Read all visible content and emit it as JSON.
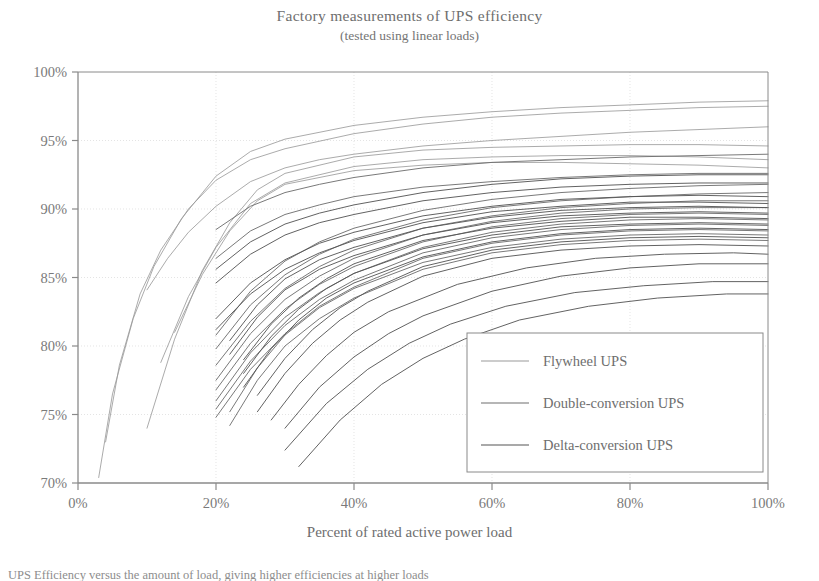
{
  "chart_data": {
    "type": "line",
    "title": "Factory measurements of UPS efficiency",
    "subtitle": "(tested using linear loads)",
    "xlabel": "Percent of rated active power load",
    "ylabel": "",
    "xlim": [
      0,
      100
    ],
    "ylim": [
      70,
      100
    ],
    "xticks": [
      0,
      20,
      40,
      60,
      80,
      100
    ],
    "xtick_labels": [
      "0%",
      "20%",
      "40%",
      "60%",
      "80%",
      "100%"
    ],
    "yticks": [
      70,
      75,
      80,
      85,
      90,
      95,
      100
    ],
    "ytick_labels": [
      "70%",
      "75%",
      "80%",
      "85%",
      "90%",
      "95%",
      "100%"
    ],
    "grid": true,
    "grid_color": "#d8d8d8",
    "axis_color": "#8a8a8a",
    "background": "#ffffff",
    "legend_position": "lower right",
    "legend": [
      {
        "name": "Flywheel UPS",
        "color": "#9a9a9a"
      },
      {
        "name": "Double-conversion UPS",
        "color": "#6e6e6e"
      },
      {
        "name": "Delta-conversion UPS",
        "color": "#555555"
      }
    ],
    "series": [
      {
        "name": "Flywheel UPS",
        "group": "flywheel",
        "color": "#9a9a9a",
        "width": 0.9,
        "x": [
          3,
          5,
          8,
          11,
          15,
          20,
          25,
          30,
          40,
          50,
          60,
          70,
          80,
          90,
          100
        ],
        "y": [
          70.4,
          76.5,
          82.0,
          85.8,
          89.3,
          92.4,
          94.2,
          95.1,
          96.1,
          96.7,
          97.1,
          97.4,
          97.6,
          97.8,
          97.9
        ]
      },
      {
        "name": "Flywheel UPS",
        "group": "flywheel",
        "color": "#9a9a9a",
        "width": 0.9,
        "x": [
          4,
          6,
          9,
          12,
          16,
          20,
          25,
          30,
          40,
          50,
          60,
          70,
          80,
          90,
          100
        ],
        "y": [
          73.0,
          78.6,
          83.8,
          87.0,
          90.0,
          92.1,
          93.6,
          94.4,
          95.5,
          96.2,
          96.7,
          97.0,
          97.2,
          97.4,
          97.5
        ]
      },
      {
        "name": "Flywheel UPS",
        "group": "flywheel",
        "color": "#9a9a9a",
        "width": 0.9,
        "x": [
          10,
          13,
          16,
          20,
          25,
          30,
          35,
          40,
          50,
          60,
          70,
          80,
          90,
          100
        ],
        "y": [
          84.1,
          86.4,
          88.3,
          90.2,
          92.0,
          93.0,
          93.6,
          94.0,
          94.6,
          95.0,
          95.3,
          95.6,
          95.8,
          96.0
        ]
      },
      {
        "name": "Flywheel UPS",
        "group": "flywheel",
        "color": "#9a9a9a",
        "width": 0.9,
        "x": [
          10,
          14,
          18,
          22,
          26,
          30,
          40,
          50,
          60,
          70,
          80,
          90,
          100
        ],
        "y": [
          74.0,
          80.5,
          85.5,
          89.0,
          91.4,
          92.6,
          93.8,
          94.3,
          94.5,
          94.6,
          94.7,
          94.7,
          94.6
        ]
      },
      {
        "name": "Flywheel UPS",
        "group": "flywheel",
        "color": "#9a9a9a",
        "width": 0.9,
        "x": [
          12,
          16,
          20,
          25,
          30,
          40,
          50,
          60,
          70,
          80,
          90,
          100
        ],
        "y": [
          78.8,
          83.6,
          87.2,
          90.4,
          91.9,
          93.1,
          93.6,
          93.8,
          93.9,
          93.9,
          93.8,
          93.6
        ]
      },
      {
        "name": "Flywheel UPS",
        "group": "flywheel",
        "color": "#9a9a9a",
        "width": 0.9,
        "x": [
          14,
          18,
          22,
          26,
          30,
          40,
          50,
          60,
          70,
          80,
          90,
          100
        ],
        "y": [
          81.0,
          85.2,
          88.4,
          90.6,
          91.8,
          92.8,
          93.2,
          93.4,
          93.4,
          93.3,
          93.2,
          93.0
        ]
      },
      {
        "name": "Double-conversion UPS",
        "group": "double",
        "color": "#6e6e6e",
        "width": 1.0,
        "x": [
          20,
          25,
          30,
          35,
          40,
          50,
          60,
          70,
          80,
          90,
          100
        ],
        "y": [
          88.5,
          90.2,
          91.2,
          91.8,
          92.3,
          93.0,
          93.4,
          93.6,
          93.8,
          93.9,
          94.0
        ]
      },
      {
        "name": "Double-conversion UPS",
        "group": "double",
        "color": "#6e6e6e",
        "width": 1.0,
        "x": [
          20,
          25,
          30,
          35,
          40,
          50,
          60,
          70,
          80,
          90,
          100
        ],
        "y": [
          86.4,
          88.4,
          89.6,
          90.3,
          90.9,
          91.6,
          92.0,
          92.3,
          92.5,
          92.6,
          92.6
        ]
      },
      {
        "name": "Double-conversion UPS",
        "group": "double",
        "color": "#6e6e6e",
        "width": 1.0,
        "x": [
          20,
          25,
          30,
          35,
          40,
          50,
          60,
          70,
          80,
          90,
          100
        ],
        "y": [
          80.8,
          84.0,
          86.2,
          87.6,
          88.6,
          89.9,
          90.7,
          91.2,
          91.5,
          91.7,
          91.8
        ]
      },
      {
        "name": "Double-conversion UPS",
        "group": "double",
        "color": "#6e6e6e",
        "width": 1.0,
        "x": [
          20,
          25,
          30,
          35,
          40,
          50,
          60,
          70,
          80,
          90,
          100
        ],
        "y": [
          79.8,
          83.0,
          85.2,
          86.7,
          87.8,
          89.2,
          90.1,
          90.6,
          90.9,
          91.1,
          91.2
        ]
      },
      {
        "name": "Double-conversion UPS",
        "group": "double",
        "color": "#6e6e6e",
        "width": 1.0,
        "x": [
          20,
          25,
          30,
          35,
          40,
          50,
          60,
          70,
          80,
          90,
          100
        ],
        "y": [
          78.6,
          81.8,
          84.2,
          85.8,
          87.0,
          88.6,
          89.5,
          90.1,
          90.4,
          90.6,
          90.6
        ]
      },
      {
        "name": "Double-conversion UPS",
        "group": "double",
        "color": "#6e6e6e",
        "width": 1.0,
        "x": [
          20,
          25,
          30,
          35,
          40,
          50,
          60,
          70,
          80,
          90,
          100
        ],
        "y": [
          77.5,
          80.9,
          83.4,
          85.1,
          86.4,
          88.1,
          89.1,
          89.7,
          90.0,
          90.1,
          90.1
        ]
      },
      {
        "name": "Double-conversion UPS",
        "group": "double",
        "color": "#6e6e6e",
        "width": 1.0,
        "x": [
          20,
          25,
          30,
          35,
          40,
          50,
          60,
          70,
          80,
          90,
          100
        ],
        "y": [
          76.8,
          80.2,
          82.7,
          84.5,
          85.8,
          87.6,
          88.7,
          89.3,
          89.6,
          89.7,
          89.6
        ]
      },
      {
        "name": "Double-conversion UPS",
        "group": "double",
        "color": "#6e6e6e",
        "width": 1.0,
        "x": [
          20,
          25,
          30,
          35,
          40,
          50,
          60,
          70,
          80,
          90,
          100
        ],
        "y": [
          76.0,
          79.5,
          82.1,
          83.9,
          85.3,
          87.2,
          88.3,
          88.9,
          89.2,
          89.3,
          89.2
        ]
      },
      {
        "name": "Double-conversion UPS",
        "group": "double",
        "color": "#6e6e6e",
        "width": 1.0,
        "x": [
          20,
          25,
          30,
          35,
          40,
          50,
          60,
          70,
          80,
          90,
          100
        ],
        "y": [
          75.4,
          78.9,
          81.5,
          83.4,
          84.8,
          86.8,
          87.9,
          88.5,
          88.8,
          88.9,
          88.8
        ]
      },
      {
        "name": "Double-conversion UPS",
        "group": "double",
        "color": "#6e6e6e",
        "width": 1.0,
        "x": [
          20,
          25,
          30,
          35,
          40,
          50,
          60,
          70,
          80,
          90,
          100
        ],
        "y": [
          74.8,
          78.3,
          80.9,
          82.9,
          84.3,
          86.4,
          87.5,
          88.1,
          88.4,
          88.5,
          88.4
        ]
      },
      {
        "name": "Double-conversion UPS",
        "group": "double",
        "color": "#6e6e6e",
        "width": 1.0,
        "x": [
          22,
          26,
          30,
          35,
          40,
          50,
          60,
          70,
          80,
          90,
          100
        ],
        "y": [
          75.2,
          78.4,
          80.8,
          82.8,
          84.2,
          86.1,
          87.2,
          87.8,
          88.1,
          88.2,
          88.1
        ]
      },
      {
        "name": "Double-conversion UPS",
        "group": "double",
        "color": "#6e6e6e",
        "width": 1.0,
        "x": [
          22,
          26,
          30,
          35,
          40,
          50,
          60,
          70,
          80,
          90,
          100
        ],
        "y": [
          74.2,
          77.5,
          80.0,
          82.0,
          83.5,
          85.6,
          86.8,
          87.4,
          87.7,
          87.8,
          87.7
        ]
      },
      {
        "name": "Delta-conversion UPS",
        "group": "delta",
        "color": "#555555",
        "width": 1.0,
        "x": [
          20,
          25,
          30,
          35,
          40,
          50,
          60,
          70,
          80,
          90,
          100
        ],
        "y": [
          85.6,
          87.6,
          88.9,
          89.7,
          90.3,
          91.2,
          91.8,
          92.2,
          92.4,
          92.5,
          92.5
        ]
      },
      {
        "name": "Delta-conversion UPS",
        "group": "delta",
        "color": "#555555",
        "width": 1.0,
        "x": [
          20,
          25,
          30,
          35,
          40,
          50,
          60,
          70,
          80,
          90,
          100
        ],
        "y": [
          84.6,
          86.7,
          88.1,
          89.0,
          89.6,
          90.6,
          91.2,
          91.6,
          91.8,
          91.9,
          91.9
        ]
      },
      {
        "name": "Delta-conversion UPS",
        "group": "delta",
        "color": "#555555",
        "width": 1.0,
        "x": [
          20,
          25,
          30,
          35,
          40,
          50,
          60,
          70,
          80,
          90,
          100
        ],
        "y": [
          82.0,
          84.6,
          86.3,
          87.5,
          88.3,
          89.5,
          90.2,
          90.7,
          90.9,
          91.0,
          90.9
        ]
      },
      {
        "name": "Delta-conversion UPS",
        "group": "delta",
        "color": "#555555",
        "width": 1.0,
        "x": [
          20,
          25,
          30,
          35,
          40,
          50,
          60,
          70,
          80,
          90,
          100
        ],
        "y": [
          81.2,
          83.8,
          85.6,
          86.8,
          87.7,
          89.0,
          89.8,
          90.2,
          90.5,
          90.5,
          90.4
        ]
      },
      {
        "name": "Delta-conversion UPS",
        "group": "delta",
        "color": "#555555",
        "width": 1.0,
        "x": [
          22,
          26,
          30,
          35,
          40,
          50,
          60,
          70,
          80,
          90,
          100
        ],
        "y": [
          80.4,
          83.0,
          84.9,
          86.3,
          87.2,
          88.6,
          89.4,
          89.9,
          90.1,
          90.2,
          90.1
        ]
      },
      {
        "name": "Delta-conversion UPS",
        "group": "delta",
        "color": "#555555",
        "width": 1.0,
        "x": [
          22,
          26,
          30,
          35,
          40,
          50,
          60,
          70,
          80,
          90,
          100
        ],
        "y": [
          79.4,
          82.1,
          84.1,
          85.6,
          86.6,
          88.1,
          89.0,
          89.5,
          89.7,
          89.8,
          89.7
        ]
      },
      {
        "name": "Delta-conversion UPS",
        "group": "delta",
        "color": "#555555",
        "width": 1.0,
        "x": [
          24,
          28,
          32,
          36,
          40,
          50,
          60,
          70,
          80,
          90,
          100
        ],
        "y": [
          79.0,
          81.6,
          83.5,
          84.9,
          86.0,
          87.7,
          88.6,
          89.1,
          89.4,
          89.4,
          89.3
        ]
      },
      {
        "name": "Delta-conversion UPS",
        "group": "delta",
        "color": "#555555",
        "width": 1.0,
        "x": [
          24,
          28,
          32,
          36,
          40,
          50,
          60,
          70,
          80,
          90,
          100
        ],
        "y": [
          78.0,
          80.7,
          82.7,
          84.2,
          85.3,
          87.1,
          88.1,
          88.7,
          88.9,
          89.0,
          88.9
        ]
      },
      {
        "name": "Delta-conversion UPS",
        "group": "delta",
        "color": "#555555",
        "width": 1.0,
        "x": [
          24,
          28,
          32,
          36,
          40,
          50,
          60,
          70,
          80,
          90,
          100
        ],
        "y": [
          77.0,
          79.8,
          81.9,
          83.5,
          84.6,
          86.5,
          87.6,
          88.2,
          88.5,
          88.6,
          88.5
        ]
      },
      {
        "name": "Delta-conversion UPS",
        "group": "delta",
        "color": "#555555",
        "width": 1.0,
        "x": [
          26,
          30,
          34,
          38,
          42,
          50,
          60,
          70,
          80,
          90,
          100
        ],
        "y": [
          76.4,
          79.1,
          81.2,
          82.8,
          84.0,
          85.8,
          87.0,
          87.6,
          87.9,
          88.0,
          87.9
        ]
      },
      {
        "name": "Delta-conversion UPS",
        "group": "delta",
        "color": "#555555",
        "width": 1.0,
        "x": [
          26,
          30,
          34,
          38,
          42,
          50,
          60,
          70,
          80,
          90,
          100
        ],
        "y": [
          75.2,
          78.0,
          80.2,
          81.9,
          83.2,
          85.1,
          86.4,
          87.0,
          87.3,
          87.4,
          87.3
        ]
      },
      {
        "name": "Delta-conversion UPS",
        "group": "delta",
        "color": "#555555",
        "width": 1.0,
        "x": [
          28,
          32,
          36,
          40,
          45,
          55,
          65,
          75,
          85,
          95,
          100
        ],
        "y": [
          74.6,
          77.2,
          79.3,
          81.0,
          82.5,
          84.5,
          85.7,
          86.4,
          86.7,
          86.8,
          86.7
        ]
      },
      {
        "name": "Delta-conversion UPS",
        "group": "delta",
        "color": "#555555",
        "width": 1.0,
        "x": [
          30,
          35,
          40,
          45,
          50,
          60,
          70,
          80,
          90,
          100
        ],
        "y": [
          74.0,
          77.0,
          79.2,
          80.9,
          82.2,
          84.0,
          85.1,
          85.7,
          86.0,
          86.0
        ]
      },
      {
        "name": "Delta-conversion UPS",
        "group": "delta",
        "color": "#555555",
        "width": 1.0,
        "x": [
          30,
          36,
          42,
          48,
          54,
          62,
          72,
          82,
          92,
          100
        ],
        "y": [
          72.4,
          75.8,
          78.3,
          80.2,
          81.6,
          82.9,
          83.9,
          84.4,
          84.7,
          84.7
        ]
      },
      {
        "name": "Delta-conversion UPS",
        "group": "delta",
        "color": "#555555",
        "width": 1.0,
        "x": [
          32,
          38,
          44,
          50,
          56,
          64,
          74,
          84,
          94,
          100
        ],
        "y": [
          71.2,
          74.6,
          77.2,
          79.1,
          80.5,
          81.9,
          82.9,
          83.5,
          83.8,
          83.8
        ]
      }
    ]
  },
  "caption": {
    "text": "UPS Efficiency versus the amount of load, giving higher efficiencies at higher loads"
  }
}
